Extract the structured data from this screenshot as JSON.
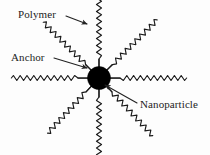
{
  "figure": {
    "type": "schematic-diagram",
    "background_color": "#fdfdfd",
    "stroke_color": "#1a1a1a",
    "core_color": "#000000"
  },
  "labels": {
    "polymer": "Polymer",
    "anchor": "Anchor",
    "nanoparticle": "Nanoparticle"
  },
  "diagram": {
    "core": {
      "name": "nanoparticle-core",
      "cx": 99,
      "cy": 78,
      "r": 11.5,
      "fill": "#000000"
    },
    "arms": [
      {
        "name": "chain-up",
        "angle_deg": 90,
        "anchor_length": 9,
        "chain_length": 66
      },
      {
        "name": "chain-upper-right",
        "angle_deg": 45,
        "anchor_length": 9,
        "chain_length": 60
      },
      {
        "name": "chain-right",
        "angle_deg": 0,
        "anchor_length": 11,
        "chain_length": 64
      },
      {
        "name": "chain-lower-right",
        "angle_deg": -47,
        "anchor_length": 9,
        "chain_length": 57
      },
      {
        "name": "chain-down",
        "angle_deg": -90,
        "anchor_length": 9,
        "chain_length": 62
      },
      {
        "name": "chain-lower-left",
        "angle_deg": -133,
        "anchor_length": 9,
        "chain_length": 56
      },
      {
        "name": "chain-left",
        "angle_deg": 180,
        "anchor_length": 11,
        "chain_length": 64
      },
      {
        "name": "chain-upper-left",
        "angle_deg": 135,
        "anchor_length": 9,
        "chain_length": 58
      }
    ]
  },
  "callouts": [
    {
      "name": "polymer-callout",
      "label_key": "polymer",
      "text_x": 18,
      "text_y": 18,
      "line": {
        "x1": 66,
        "y1": 16,
        "x2": 87,
        "y2": 24
      },
      "arrow": true
    },
    {
      "name": "anchor-callout",
      "label_key": "anchor",
      "text_x": 11,
      "text_y": 61,
      "line": {
        "x1": 54,
        "y1": 58,
        "x2": 87,
        "y2": 68
      },
      "arrow": true
    },
    {
      "name": "nanoparticle-callout",
      "label_key": "nanoparticle",
      "text_x": 140,
      "text_y": 108,
      "line": {
        "x1": 137,
        "y1": 103,
        "x2": 105,
        "y2": 85
      },
      "arrow": true
    }
  ]
}
